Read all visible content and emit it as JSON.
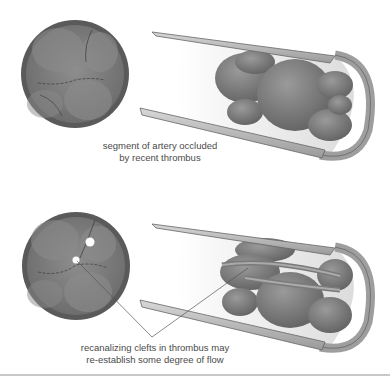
{
  "figure": {
    "top_panel": {
      "caption_line1": "segment of artery occluded",
      "caption_line2": "by recent thrombus"
    },
    "bottom_panel": {
      "caption_line1": "recanalizing clefts in thrombus may",
      "caption_line2": "re-establish some degree of flow"
    }
  },
  "colors": {
    "vessel_wall": "#a9a9a9",
    "vessel_wall_dark": "#5a5a5a",
    "thrombus": "#7d7d7d",
    "lumen_light": "#ececec"
  }
}
